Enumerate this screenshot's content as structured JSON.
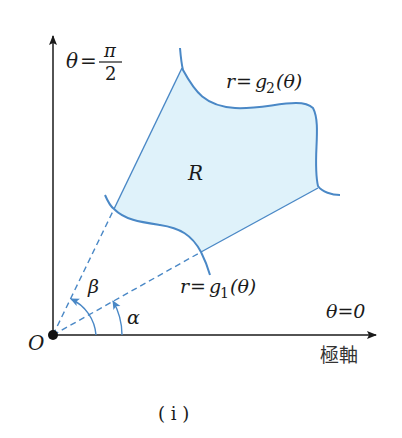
{
  "diagram": {
    "type": "polar-region",
    "colors": {
      "axis": "#1a1a1a",
      "curve": "#4a88c6",
      "fill": "#dff2fa",
      "ray": "#4a88c6"
    },
    "labels": {
      "vertical_axis_theta": "θ",
      "vertical_axis_eq": "=",
      "vertical_axis_num": "π",
      "vertical_axis_den": "2",
      "outer_curve_r": "r",
      "outer_curve_eq": "=",
      "outer_curve_g": "g",
      "outer_curve_sub": "2",
      "outer_curve_arg": "(θ)",
      "inner_curve_r": "r",
      "inner_curve_eq": "=",
      "inner_curve_g": "g",
      "inner_curve_sub": "1",
      "inner_curve_arg": "(θ)",
      "region": "R",
      "angle_beta": "β",
      "angle_alpha": "α",
      "polar_axis_theta": "θ=0",
      "polar_axis_name": "極軸",
      "origin": "O",
      "caption": "( i )"
    }
  }
}
